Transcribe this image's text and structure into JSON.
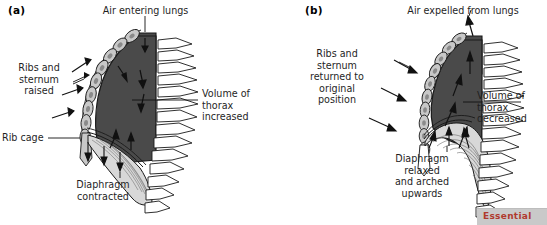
{
  "figure": {
    "colors": {
      "thorax_fill": "#4a4a4a",
      "rib_fill": "#c8c8c8",
      "rib_nucleus": "#8a8a8a",
      "diaphragm_fill": "#d8d8d8",
      "outline": "#1a1a1a",
      "background": "#ffffff",
      "cut_bar": "#c9c9c9",
      "cut_text": "#b03a2e"
    }
  },
  "panels": [
    {
      "id": "a",
      "panel_label": "(a)",
      "phase": "inhalation",
      "labels": {
        "top": "Air entering lungs",
        "left_upper": "Ribs and\nsternum\nraised",
        "left_lower": "Rib cage",
        "right": "Volume of\nthorax\nincreased",
        "bottom": "Diaphragm\ncontracted"
      }
    },
    {
      "id": "b",
      "panel_label": "(b)",
      "phase": "exhalation",
      "labels": {
        "top": "Air expelled from lungs",
        "left_upper": "Ribs and\nsternum\nreturned to\noriginal\nposition",
        "right": "Volume of\nthorax\ndecreased",
        "bottom": "Diaphragm\nrelaxed\nand arched\nupwards"
      }
    }
  ],
  "overlay": {
    "cut_bar_text": "Essential"
  }
}
